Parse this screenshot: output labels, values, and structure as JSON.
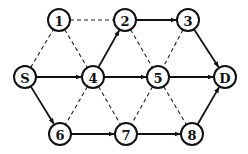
{
  "diagram": {
    "type": "directed-network-graph",
    "colors": {
      "stroke": "#111111",
      "background": "#ffffff",
      "node_fill": "#ffffff"
    },
    "node_radius": 11,
    "nodes": [
      {
        "id": "1",
        "label": "1",
        "x": 59,
        "y": 20
      },
      {
        "id": "2",
        "label": "2",
        "x": 125,
        "y": 20
      },
      {
        "id": "3",
        "label": "3",
        "x": 188,
        "y": 20
      },
      {
        "id": "S",
        "label": "S",
        "x": 25,
        "y": 77
      },
      {
        "id": "4",
        "label": "4",
        "x": 93,
        "y": 77
      },
      {
        "id": "5",
        "label": "5",
        "x": 158,
        "y": 77
      },
      {
        "id": "D",
        "label": "D",
        "x": 225,
        "y": 77
      },
      {
        "id": "6",
        "label": "6",
        "x": 60,
        "y": 134
      },
      {
        "id": "7",
        "label": "7",
        "x": 126,
        "y": 134
      },
      {
        "id": "8",
        "label": "8",
        "x": 192,
        "y": 134
      }
    ],
    "solid_edges": [
      {
        "from": "S",
        "to": "4"
      },
      {
        "from": "4",
        "to": "5"
      },
      {
        "from": "5",
        "to": "D"
      },
      {
        "from": "4",
        "to": "2"
      },
      {
        "from": "2",
        "to": "3"
      },
      {
        "from": "3",
        "to": "D"
      },
      {
        "from": "S",
        "to": "6"
      },
      {
        "from": "6",
        "to": "7"
      },
      {
        "from": "7",
        "to": "8"
      },
      {
        "from": "8",
        "to": "D"
      }
    ],
    "dashed_edges": [
      {
        "from": "1",
        "to": "2"
      },
      {
        "from": "S",
        "to": "1"
      },
      {
        "from": "1",
        "to": "4"
      },
      {
        "from": "2",
        "to": "5"
      },
      {
        "from": "3",
        "to": "5"
      },
      {
        "from": "4",
        "to": "6"
      },
      {
        "from": "4",
        "to": "7"
      },
      {
        "from": "5",
        "to": "7"
      },
      {
        "from": "5",
        "to": "8"
      }
    ]
  }
}
